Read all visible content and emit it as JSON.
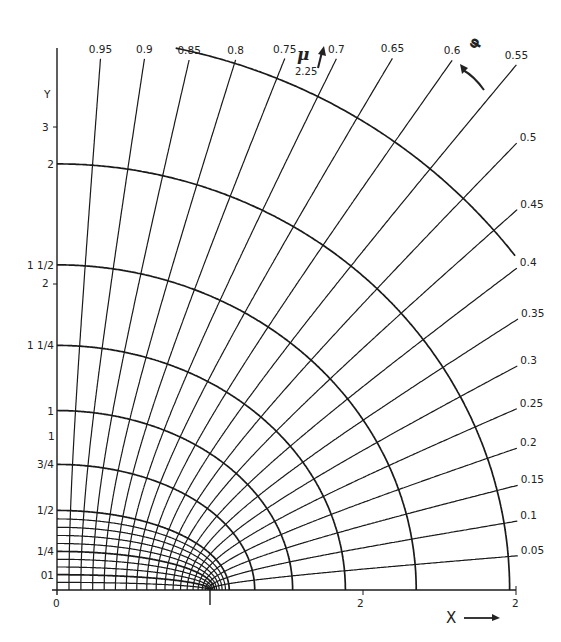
{
  "diagram": {
    "type": "elliptic-coordinate-grid",
    "colors": {
      "line": "#1a1a1a",
      "text": "#222222",
      "background": "#ffffff"
    },
    "axes": {
      "x_label": "X",
      "x_arrow": "→",
      "y_label": "Y",
      "x_ticks": [
        "0",
        "1",
        "2",
        "3"
      ],
      "y_ticks": [
        "1",
        "2",
        "3"
      ]
    },
    "ellipses": [
      {
        "mu": 0.1,
        "label": "01"
      },
      {
        "mu": 0.25,
        "label": "1/4"
      },
      {
        "mu": 0.5,
        "label": "1/2"
      },
      {
        "mu": 0.75,
        "label": "3/4"
      },
      {
        "mu": 1.0,
        "label": "1"
      },
      {
        "mu": 1.25,
        "label": "1 1/4"
      },
      {
        "mu": 1.5,
        "label": "1 1/2"
      },
      {
        "mu": 1.75,
        "label": "2"
      },
      {
        "mu": 2.0,
        "label": ""
      }
    ],
    "mu_axis": {
      "symbol": "μ",
      "value": "2.25",
      "arrow": "↑"
    },
    "phi_axis": {
      "symbol": "φ",
      "arrow": "↖"
    },
    "hyperbolas": [
      "0.05",
      "0.1",
      "0.15",
      "0.2",
      "0.25",
      "0.3",
      "0.35",
      "0.4",
      "0.45",
      "0.5",
      "0.55",
      "0.6",
      "0.65",
      "0.7",
      "0.75",
      "0.8",
      "0.85",
      "0.9",
      "0.95"
    ],
    "extra_y_label": "1",
    "minor_mu": [
      0.05,
      0.15,
      0.2,
      0.3,
      0.35,
      0.4,
      0.45
    ]
  }
}
